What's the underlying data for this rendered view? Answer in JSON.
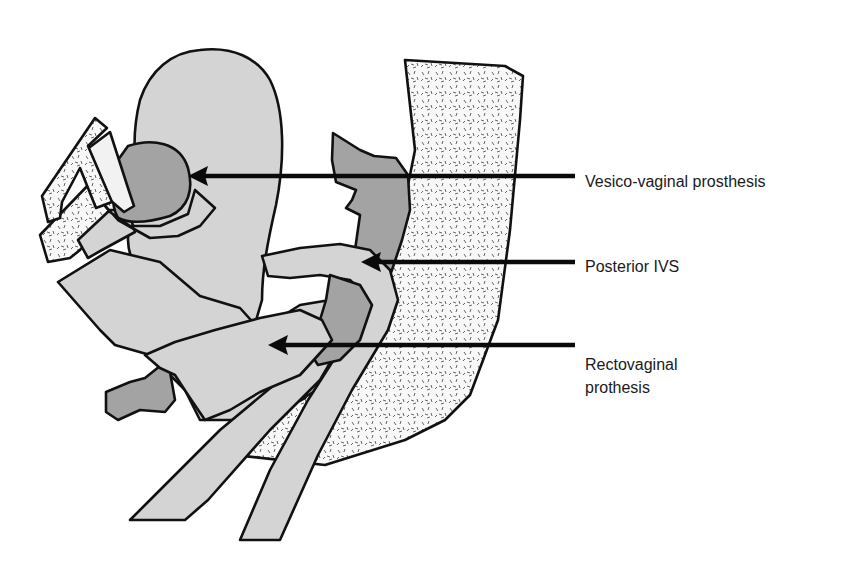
{
  "figure": {
    "type": "anatomical-schematic",
    "colors": {
      "background": "#ffffff",
      "light_tissue": "#d4d4d4",
      "dark_tissue": "#a3a3a3",
      "bone_fill": "#f7f7f7",
      "outline": "#111111",
      "arrow": "#0a0a0a"
    }
  },
  "labels": [
    {
      "id": "vesico",
      "text": "Vesico-vaginal prosthesis"
    },
    {
      "id": "ivs",
      "text": "Posterior IVS"
    },
    {
      "id": "recto_line1",
      "text": "Rectovaginal"
    },
    {
      "id": "recto_line2",
      "text": "prothesis"
    }
  ]
}
